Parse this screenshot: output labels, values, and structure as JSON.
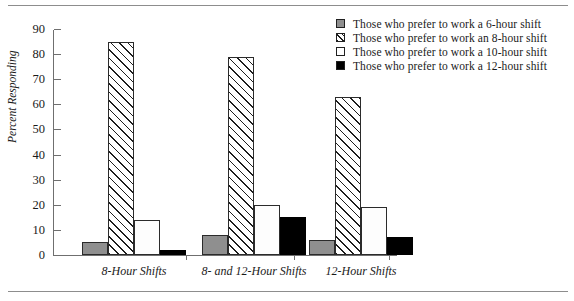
{
  "chart_data": {
    "type": "bar",
    "title": "",
    "xlabel": "",
    "ylabel": "Percent Responding",
    "ylim": [
      0,
      90
    ],
    "yticks": [
      0,
      10,
      20,
      30,
      40,
      50,
      60,
      70,
      80,
      90
    ],
    "grid": false,
    "legend_position": "top-right",
    "categories": [
      "8-Hour Shifts",
      "8- and 12-Hour Shifts",
      "12-Hour Shifts"
    ],
    "series": [
      {
        "name": "Those who prefer to work a 6-hour shift",
        "swatch": "gray",
        "color": "#8f8f8f",
        "values": [
          5,
          8,
          6
        ]
      },
      {
        "name": "Those who prefer to work an 8-hour shift",
        "swatch": "hatch",
        "color": "#ffffff",
        "values": [
          85,
          79,
          63
        ]
      },
      {
        "name": "Those who prefer to work a 10-hour shift",
        "swatch": "white",
        "color": "#ffffff",
        "values": [
          14,
          20,
          19
        ]
      },
      {
        "name": "Those who prefer to work a 12-hour shift",
        "swatch": "black",
        "color": "#000000",
        "values": [
          2,
          15,
          7
        ]
      }
    ]
  }
}
